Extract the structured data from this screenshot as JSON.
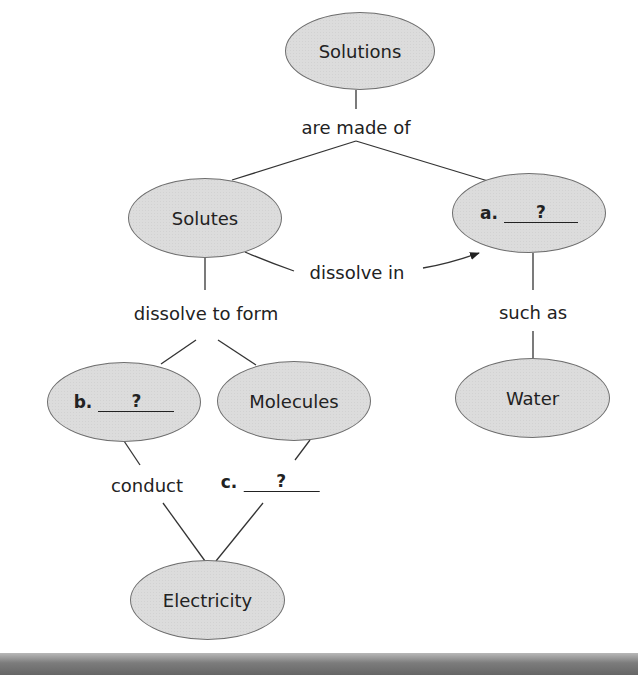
{
  "diagram": {
    "type": "concept-map",
    "nodes": {
      "solutions": "Solutions",
      "solutes": "Solutes",
      "a": {
        "letter": "a.",
        "answer": "?"
      },
      "water": "Water",
      "b": {
        "letter": "b.",
        "answer": "?"
      },
      "molecules": "Molecules",
      "electricity": "Electricity"
    },
    "links": {
      "are_made_of": "are made of",
      "dissolve_in": "dissolve in",
      "such_as": "such as",
      "dissolve_to_form": "dissolve to form",
      "conduct": "conduct",
      "c": {
        "letter": "c.",
        "answer": "?"
      }
    },
    "colors": {
      "node_fill": "#dcdcdc",
      "node_border": "#6e6e6e",
      "line": "#333333",
      "bottom_bar": "#7c7c7c"
    }
  }
}
